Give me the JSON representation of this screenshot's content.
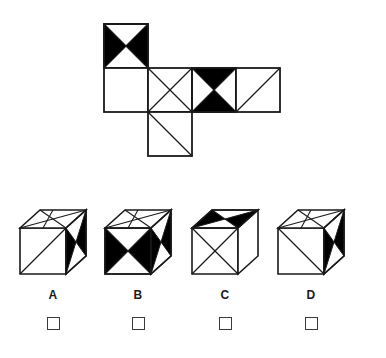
{
  "puzzle": {
    "type": "cube-net-folding",
    "title": "",
    "stroke_color": "#1a1a1a",
    "fill_black": "#000000",
    "fill_white": "#ffffff",
    "background": "#ffffff"
  },
  "net": {
    "name": "cube-unfolded-net",
    "cell_size": 44,
    "origin": {
      "x": 104,
      "y": 24
    },
    "faces": [
      {
        "id": "net-face-top",
        "col": 0,
        "row": 0,
        "pattern": "bowtie-horizontal-black"
      },
      {
        "id": "net-face-row2-col0",
        "col": 0,
        "row": 1,
        "pattern": "blank"
      },
      {
        "id": "net-face-row2-col1",
        "col": 1,
        "row": 1,
        "pattern": "x-cross-white"
      },
      {
        "id": "net-face-row2-col2",
        "col": 2,
        "row": 1,
        "pattern": "bowtie-vertical-black"
      },
      {
        "id": "net-face-row2-col3",
        "col": 3,
        "row": 1,
        "pattern": "diagonal-bl-tr"
      },
      {
        "id": "net-face-bottom",
        "col": 1,
        "row": 2,
        "pattern": "diagonal-tl-br"
      }
    ]
  },
  "options": [
    {
      "id": "option-a",
      "label": "A",
      "faces": {
        "top": "x-cross-white",
        "front": "diagonal-tl-br",
        "right": "bowtie-black"
      },
      "checkbox_checked": false
    },
    {
      "id": "option-b",
      "label": "B",
      "faces": {
        "top": "x-cross-white",
        "front": "bowtie-horizontal-black",
        "right": "bowtie-black"
      },
      "checkbox_checked": false
    },
    {
      "id": "option-c",
      "label": "C",
      "faces": {
        "top": "bowtie-black",
        "front": "x-cross-white",
        "right": "blank"
      },
      "checkbox_checked": false
    },
    {
      "id": "option-d",
      "label": "D",
      "faces": {
        "top": "x-cross-white",
        "front": "diagonal-tl-br",
        "right": "bowtie-black"
      },
      "checkbox_checked": false
    }
  ],
  "answer_row": {
    "name": "answer-checkbox-row",
    "checkbox_size": 13,
    "boxes": [
      {
        "for": "A",
        "checked": false
      },
      {
        "for": "B",
        "checked": false
      },
      {
        "for": "C",
        "checked": false
      },
      {
        "for": "D",
        "checked": false
      }
    ]
  },
  "labels": {
    "a": "A",
    "b": "B",
    "c": "C",
    "d": "D"
  }
}
